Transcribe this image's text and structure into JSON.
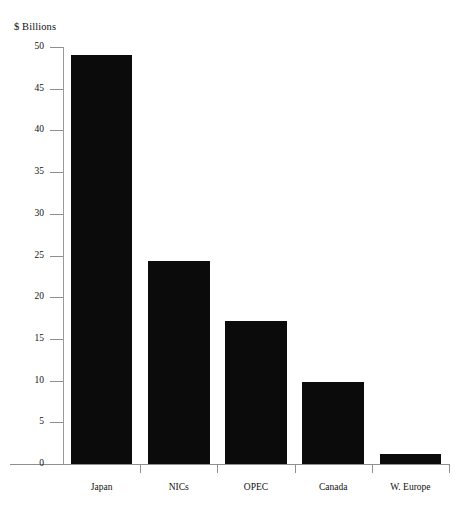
{
  "chart_data": {
    "type": "bar",
    "title": "",
    "subtitle": "",
    "xlabel": "",
    "ylabel": "$ Billions",
    "ylim": [
      0,
      50
    ],
    "yticks": [
      0,
      5,
      10,
      15,
      20,
      25,
      30,
      35,
      40,
      45,
      50
    ],
    "ytick_labels": [
      "0",
      "5",
      "10",
      "15",
      "20",
      "25",
      "30",
      "35",
      "40",
      "45",
      "50"
    ],
    "grid": false,
    "legend": false,
    "legend_position": "none",
    "bar_color": "#0b0b0b",
    "axis_color": "#8f8f8f",
    "categories": [
      "Japan",
      "NICs",
      "OPEC",
      "Canada",
      "W. Europe"
    ],
    "values": [
      49.0,
      24.4,
      17.2,
      9.8,
      1.2
    ],
    "annotations": []
  },
  "axis": {
    "y_title": "$ Billions"
  }
}
